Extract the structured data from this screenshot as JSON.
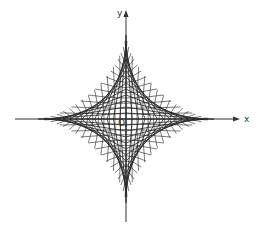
{
  "diagram": {
    "type": "astroid-envelope",
    "axes": {
      "x_label": "x",
      "y_label": "y",
      "origin_label": "O"
    },
    "geometry": {
      "center": [
        126,
        119
      ],
      "radius_x": 88,
      "radius_y": 84,
      "segments_per_quadrant": 14,
      "x_axis_range": [
        15,
        240
      ],
      "y_axis_range": [
        10,
        222
      ]
    },
    "colors": {
      "lines": "#222222",
      "axes": "#333333",
      "background": "#ffffff"
    }
  }
}
